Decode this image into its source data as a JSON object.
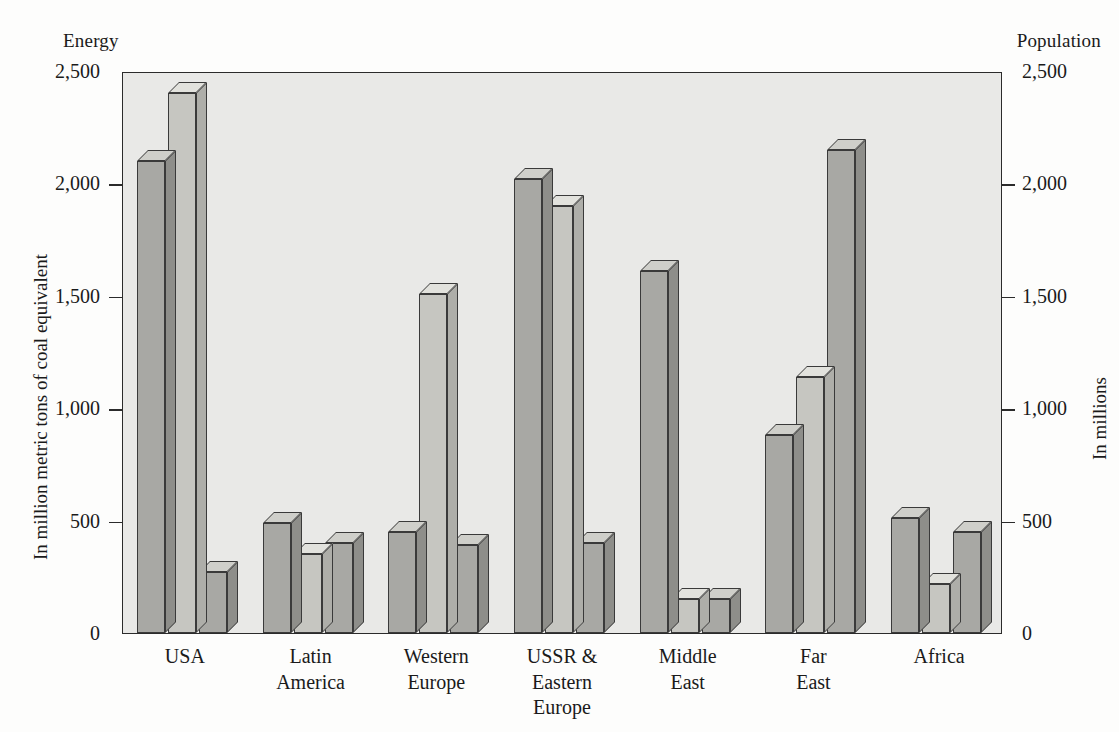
{
  "figure": {
    "title": "1984",
    "left_axis_caption": "Energy",
    "right_axis_caption": "Population",
    "left_axis_title": "In million metric tons of coal equivalent",
    "right_axis_title": "In millions"
  },
  "chart_data": {
    "type": "bar",
    "title": "1984",
    "xlabel": "",
    "ylabel": "In million metric tons of coal equivalent",
    "y2label": "In millions",
    "ylim": [
      0,
      2500
    ],
    "y2lim": [
      0,
      2500
    ],
    "yticks": [
      0,
      500,
      1000,
      1500,
      2000,
      2500
    ],
    "ytick_labels": [
      "0",
      "500",
      "1,000",
      "1,500",
      "2,000",
      "2,500"
    ],
    "y2ticks": [
      0,
      500,
      1000,
      1500,
      2000,
      2500
    ],
    "y2tick_labels": [
      "0",
      "500",
      "1,000",
      "1,500",
      "2,000",
      "2,500"
    ],
    "grid": false,
    "legend": "none",
    "categories": [
      "USA",
      "Latin\nAmerica",
      "Western\nEurope",
      "USSR &\nEastern\nEurope",
      "Middle\nEast",
      "Far\nEast",
      "Africa"
    ],
    "series": [
      {
        "name": "Energy production",
        "axis": "left",
        "shade": "dark",
        "values": [
          2100,
          490,
          450,
          2020,
          1610,
          880,
          510
        ]
      },
      {
        "name": "Energy consumption",
        "axis": "left",
        "shade": "light",
        "values": [
          2400,
          350,
          1510,
          1900,
          150,
          1140,
          220
        ]
      },
      {
        "name": "Population",
        "axis": "right",
        "shade": "dark",
        "values": [
          270,
          400,
          390,
          400,
          150,
          2150,
          450
        ]
      }
    ]
  },
  "axis": {
    "ticks": [
      {
        "value": 2500,
        "label": "2,500"
      },
      {
        "value": 2000,
        "label": "2,000"
      },
      {
        "value": 1500,
        "label": "1,500"
      },
      {
        "value": 1000,
        "label": "1,000"
      },
      {
        "value": 500,
        "label": "500"
      },
      {
        "value": 0,
        "label": "0"
      }
    ]
  }
}
